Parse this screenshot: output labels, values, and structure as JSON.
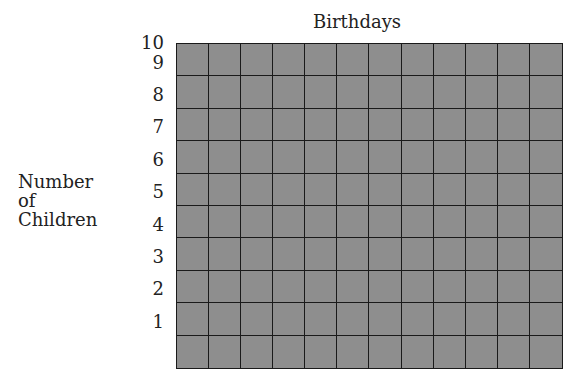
{
  "chart_data": {
    "type": "bar",
    "title": "Birthdays",
    "xlabel": "",
    "ylabel": "Number of Children",
    "ylabel_lines": [
      "Number",
      "of",
      "Children"
    ],
    "categories": [],
    "values": [],
    "ylim": [
      0,
      10
    ],
    "yticks": [
      "10",
      "9",
      "8",
      "7",
      "6",
      "5",
      "4",
      "3",
      "2",
      "1"
    ],
    "grid": true,
    "grid_columns": 12,
    "grid_rows": 10,
    "note": "Blank grid template for a bar graph; no data plotted."
  },
  "colors": {
    "grid_fill": "#8e8e8e",
    "grid_lines": "#1a1a1a"
  }
}
